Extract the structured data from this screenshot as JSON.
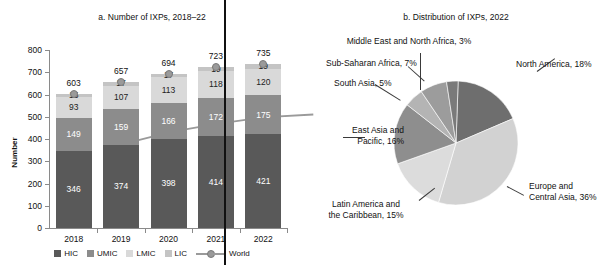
{
  "chart_data": [
    {
      "type": "bar",
      "panel": "a",
      "title": "a. Number of IXPs, 2018–22",
      "xlabel": "",
      "ylabel": "Number",
      "ylim": [
        0,
        800
      ],
      "yticks": [
        0,
        100,
        200,
        300,
        400,
        500,
        600,
        700,
        800
      ],
      "categories": [
        "2018",
        "2019",
        "2020",
        "2021",
        "2022"
      ],
      "stacked": true,
      "grid": false,
      "legend_position": "bottom",
      "series": [
        {
          "name": "HIC",
          "values": [
            346,
            374,
            398,
            414,
            421
          ],
          "color": "#595959"
        },
        {
          "name": "UMIC",
          "values": [
            149,
            159,
            166,
            172,
            175
          ],
          "color": "#8c8c8c"
        },
        {
          "name": "LMIC",
          "values": [
            93,
            107,
            113,
            118,
            120
          ],
          "color": "#d9d9d9"
        },
        {
          "name": "LIC",
          "values": [
            15,
            17,
            17,
            19,
            19
          ],
          "color": "#c4c4c4"
        },
        {
          "name": "World",
          "values": [
            603,
            657,
            694,
            723,
            735
          ],
          "color": "#9a9a9a",
          "kind": "line"
        }
      ],
      "totals": [
        603,
        657,
        694,
        723,
        735
      ]
    },
    {
      "type": "pie",
      "panel": "b",
      "title": "b. Distribution of IXPs, 2022",
      "labels": [
        "North America, 18%",
        "Europe and\nCentral Asia, 36%",
        "Latin America and\nthe Caribbean, 15%",
        "East Asia and\nPacific, 16%",
        "South Asia, 5%",
        "Sub-Saharan Africa, 7%",
        "Middle East and North Africa, 3%"
      ],
      "slices": [
        {
          "name": "North America",
          "value": 18,
          "label": "North America, 18%",
          "color": "#6e6e6e"
        },
        {
          "name": "Europe and Central Asia",
          "value": 36,
          "label": "Europe and\nCentral Asia, 36%",
          "color": "#d2d2d2"
        },
        {
          "name": "Latin America and the Caribbean",
          "value": 15,
          "label": "Latin America and\nthe Caribbean, 15%",
          "color": "#dcdcdc"
        },
        {
          "name": "East Asia and Pacific",
          "value": 16,
          "label": "East Asia and\nPacific, 16%",
          "color": "#8e8e8e"
        },
        {
          "name": "South Asia",
          "value": 5,
          "label": "South Asia, 5%",
          "color": "#b4b4b4"
        },
        {
          "name": "Sub-Saharan Africa",
          "value": 7,
          "label": "Sub-Saharan Africa, 7%",
          "color": "#9c9c9c"
        },
        {
          "name": "Middle East and North Africa",
          "value": 3,
          "label": "Middle East and North Africa, 3%",
          "color": "#7a7a7a"
        }
      ]
    }
  ],
  "panel_a": {
    "title": "a. Number of IXPs, 2018–22",
    "y_axis_title": "Number",
    "yticks": [
      "800",
      "700",
      "600",
      "500",
      "400",
      "300",
      "200",
      "100",
      "0"
    ],
    "xticks": [
      "2018",
      "2019",
      "2020",
      "2021",
      "2022"
    ],
    "totals": [
      "603",
      "657",
      "694",
      "723",
      "735"
    ],
    "bars": [
      {
        "year": "2018",
        "hic": "346",
        "umic": "149",
        "lmic": "93",
        "lic": "15"
      },
      {
        "year": "2019",
        "hic": "374",
        "umic": "159",
        "lmic": "107",
        "lic": "17"
      },
      {
        "year": "2020",
        "hic": "398",
        "umic": "166",
        "lmic": "113",
        "lic": "17"
      },
      {
        "year": "2021",
        "hic": "414",
        "umic": "172",
        "lmic": "118",
        "lic": "19"
      },
      {
        "year": "2022",
        "hic": "421",
        "umic": "175",
        "lmic": "120",
        "lic": "19"
      }
    ],
    "legend": {
      "hic": "HIC",
      "umic": "UMIC",
      "lmic": "LMIC",
      "lic": "LIC",
      "world": "World"
    }
  },
  "panel_b": {
    "title": "b. Distribution of IXPs, 2022",
    "labels": {
      "north_america": "North America, 18%",
      "europe_line1": "Europe and",
      "europe_line2": "Central Asia, 36%",
      "latam_line1": "Latin America and",
      "latam_line2": "the Caribbean, 15%",
      "eap_line1": "East Asia and",
      "eap_line2": "Pacific, 16%",
      "south_asia": "South Asia, 5%",
      "ssa": "Sub-Saharan Africa, 7%",
      "mena": "Middle East and North Africa, 3%"
    }
  },
  "colors": {
    "hic": "#595959",
    "umic": "#8c8c8c",
    "lmic": "#d9d9d9",
    "lic": "#c4c4c4",
    "world": "#9a9a9a",
    "axis": "#8a8a8a"
  }
}
